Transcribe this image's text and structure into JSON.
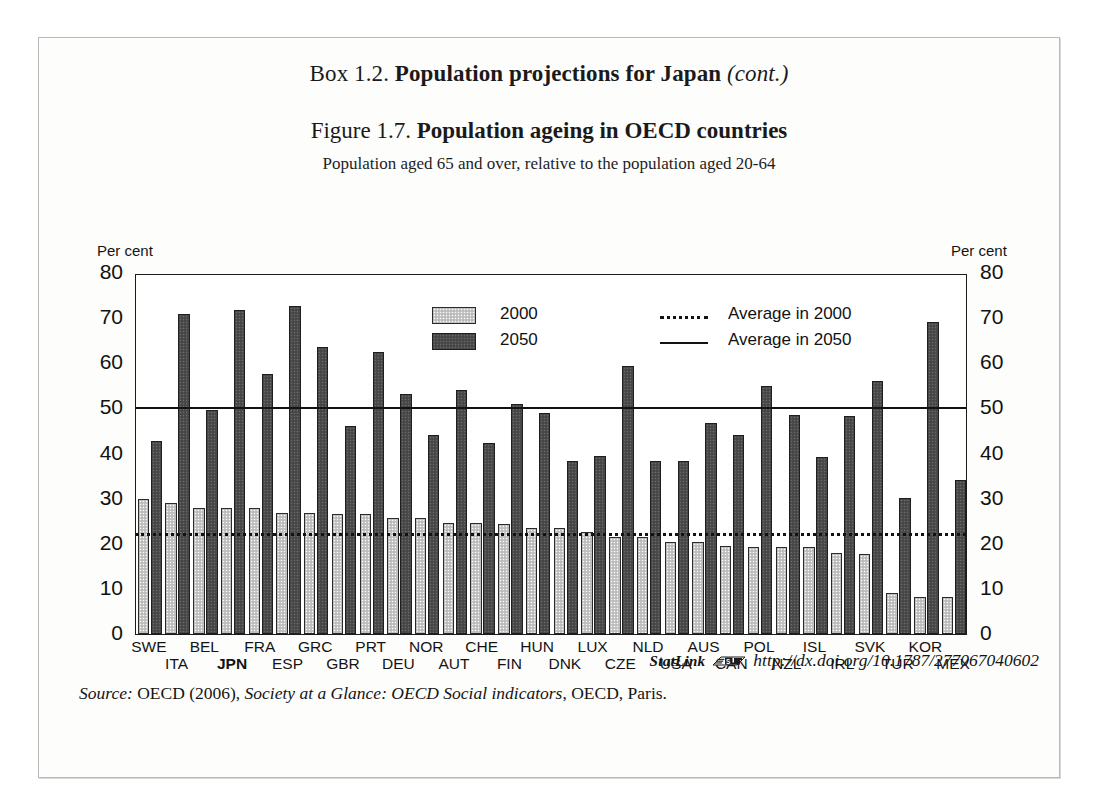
{
  "box": {
    "label": "Box 1.2.",
    "title": "Population projections for Japan",
    "cont": "(cont.)"
  },
  "figure": {
    "label": "Figure 1.7.",
    "title": "Population ageing in OECD countries",
    "subtitle": "Population aged 65 and over, relative to the population aged 20-64"
  },
  "axes": {
    "unit_left": "Per cent",
    "unit_right": "Per cent",
    "ticks": [
      "80",
      "70",
      "60",
      "50",
      "40",
      "30",
      "20",
      "10",
      "0"
    ]
  },
  "legend": {
    "series_2000": "2000",
    "series_2050": "2050",
    "avg_2000": "Average in 2000",
    "avg_2050": "Average in 2050"
  },
  "footer": {
    "statlink_word": "StatLink",
    "statlink_icon": "statlink-icon",
    "statlink_url": "http://dx.doi.org/10.1787/277067040602",
    "source_prefix": "Source:",
    "source_text_1": "OECD (2006),",
    "source_italic": "Society at a Glance: OECD Social indicators",
    "source_text_2": ", OECD, Paris."
  },
  "colors": {
    "bar_2000": "#c6c6c6",
    "bar_2050": "#4d4d4d",
    "line": "#121212",
    "frame": "#1b1b1b"
  },
  "chart_data": {
    "type": "bar",
    "title": "Population ageing in OECD countries",
    "subtitle": "Population aged 65 and over, relative to the population aged 20-64",
    "xlabel": "",
    "ylabel": "Per cent",
    "ylim": [
      0,
      80
    ],
    "yticks": [
      0,
      10,
      20,
      30,
      40,
      50,
      60,
      70,
      80
    ],
    "grid": false,
    "legend_position": "inside-top-center",
    "categories": [
      "SWE",
      "ITA",
      "BEL",
      "JPN",
      "FRA",
      "ESP",
      "GRC",
      "GBR",
      "PRT",
      "DEU",
      "NOR",
      "AUT",
      "CHE",
      "FIN",
      "HUN",
      "DNK",
      "LUX",
      "CZE",
      "NLD",
      "USA",
      "AUS",
      "CAN",
      "POL",
      "NZL",
      "ISL",
      "IRL",
      "SVK",
      "TUR",
      "KOR",
      "MEX"
    ],
    "series": [
      {
        "name": "2000",
        "values": [
          30.0,
          29.0,
          27.9,
          27.9,
          27.9,
          26.8,
          26.8,
          26.7,
          26.6,
          25.7,
          25.7,
          24.6,
          24.6,
          24.4,
          23.5,
          23.4,
          22.6,
          21.5,
          21.4,
          20.4,
          20.3,
          19.4,
          19.2,
          19.2,
          19.2,
          17.9,
          17.8,
          9.2,
          8.3,
          8.3
        ]
      },
      {
        "name": "2050",
        "values": [
          42.8,
          70.9,
          49.6,
          71.7,
          57.6,
          72.6,
          63.6,
          46.2,
          62.5,
          53.2,
          44.2,
          54.1,
          42.4,
          51.0,
          48.9,
          38.4,
          39.5,
          59.5,
          38.3,
          38.3,
          46.8,
          44.1,
          55.0,
          48.5,
          39.2,
          48.4,
          56.0,
          30.2,
          69.1,
          34.1
        ]
      }
    ],
    "reference_lines": [
      {
        "name": "Average in 2000",
        "value": 22.8,
        "style": "dotted"
      },
      {
        "name": "Average in 2050",
        "value": 50.7,
        "style": "solid"
      }
    ]
  }
}
